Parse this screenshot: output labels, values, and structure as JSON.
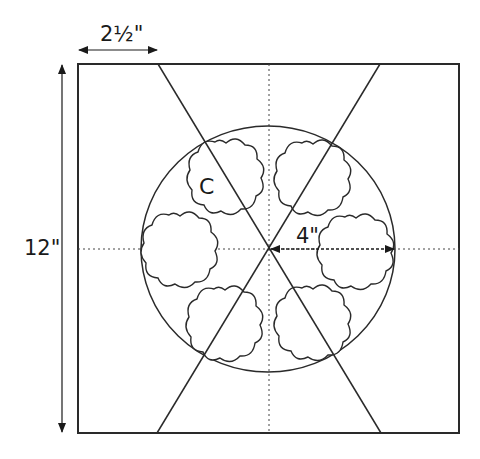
{
  "colors": {
    "line": "#2a2a2a",
    "background": "#ffffff"
  },
  "dimensions": {
    "width_label": "2½\"",
    "height_label": "12\"",
    "radius_label": "4\""
  },
  "block": {
    "size": "12\"",
    "shape": "square"
  },
  "circle": {
    "radius": "4\""
  },
  "appliques": {
    "count": 6,
    "shape": "scalloped flower",
    "label": "C"
  },
  "guides": [
    "vertical center line (dotted)",
    "horizontal center line (dotted)",
    "two diagonal cut lines"
  ]
}
